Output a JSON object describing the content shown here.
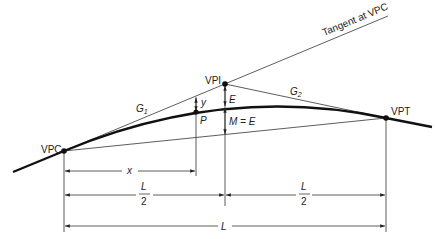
{
  "diagram": {
    "labels": {
      "tangent": "Tangent at VPC",
      "vpc": "VPC",
      "vpi": "VPI",
      "vpt": "VPT",
      "point_p": "P",
      "g1": "G",
      "g1_sub": "1",
      "g2": "G",
      "g2_sub": "2",
      "y": "y",
      "e": "E",
      "m_eq_e": "M = E",
      "x": "x",
      "half_l_num_left": "L",
      "half_l_den_left": "2",
      "half_l_num_right": "L",
      "half_l_den_right": "2",
      "full_l": "L"
    },
    "colors": {
      "line": "#222222",
      "background": "#ffffff"
    }
  }
}
